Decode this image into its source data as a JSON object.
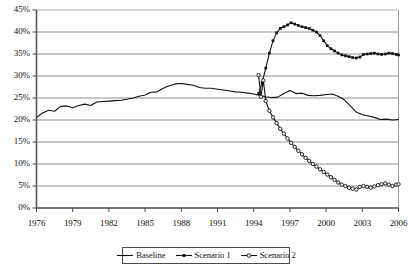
{
  "chart_data": {
    "type": "line",
    "title": "",
    "xlabel": "",
    "ylabel": "",
    "xlim": [
      1976,
      2006
    ],
    "ylim": [
      0,
      45
    ],
    "grid": true,
    "grid_axis": "y",
    "legend_position": "bottom-center",
    "ytick_labels": [
      "0%",
      "5%",
      "10%",
      "15%",
      "20%",
      "25%",
      "30%",
      "35%",
      "40%",
      "45%"
    ],
    "ytick_values": [
      0,
      5,
      10,
      15,
      20,
      25,
      30,
      35,
      40,
      45
    ],
    "xtick_labels": [
      "1976",
      "1979",
      "1982",
      "1985",
      "1988",
      "1991",
      "1994",
      "1997",
      "2000",
      "2003",
      "2006"
    ],
    "xtick_values": [
      1976,
      1979,
      1982,
      1985,
      1988,
      1991,
      1994,
      1997,
      2000,
      2003,
      2006
    ],
    "series": [
      {
        "name": "Baseline",
        "color": "#111111",
        "marker": "none",
        "x": [
          1976,
          1976.5,
          1977,
          1977.5,
          1978,
          1978.5,
          1979,
          1979.5,
          1980,
          1980.5,
          1981,
          1981.5,
          1982,
          1982.5,
          1983,
          1983.5,
          1984,
          1984.5,
          1985,
          1985.5,
          1986,
          1986.5,
          1987,
          1987.5,
          1988,
          1988.5,
          1989,
          1989.5,
          1990,
          1990.5,
          1991,
          1991.5,
          1992,
          1992.5,
          1993,
          1993.5,
          1994,
          1994.5,
          1995,
          1995.5,
          1996,
          1996.5,
          1997,
          1997.5,
          1998,
          1998.5,
          1999,
          1999.5,
          2000,
          2000.5,
          2001,
          2001.5,
          2002,
          2002.5,
          2003,
          2003.5,
          2004,
          2004.5,
          2005,
          2005.5,
          2006
        ],
        "values": [
          20.6,
          21.6,
          22.2,
          22.0,
          23.1,
          23.2,
          22.8,
          23.3,
          23.6,
          23.3,
          24.1,
          24.2,
          24.3,
          24.4,
          24.5,
          24.7,
          25.0,
          25.4,
          25.7,
          26.3,
          26.4,
          27.2,
          27.8,
          28.2,
          28.3,
          28.1,
          27.9,
          27.4,
          27.2,
          27.2,
          27.0,
          26.8,
          26.6,
          26.4,
          26.3,
          26.1,
          25.9,
          25.6,
          25.3,
          25.1,
          25.2,
          26.0,
          26.7,
          26.0,
          26.1,
          25.6,
          25.5,
          25.6,
          25.8,
          25.9,
          25.4,
          24.6,
          23.2,
          21.8,
          21.2,
          20.9,
          20.6,
          20.1,
          20.2,
          20.0,
          20.1
        ]
      },
      {
        "name": "Scenario 1",
        "color": "#111111",
        "marker": "filled-square",
        "x": [
          1994.4,
          1994.7,
          1995,
          1995.3,
          1995.6,
          1995.9,
          1996.2,
          1996.5,
          1996.8,
          1997.1,
          1997.4,
          1997.7,
          1998,
          1998.3,
          1998.6,
          1998.9,
          1999.2,
          1999.5,
          1999.8,
          2000.1,
          2000.4,
          2000.7,
          2001,
          2001.3,
          2001.6,
          2001.9,
          2002.2,
          2002.5,
          2002.8,
          2003.1,
          2003.4,
          2003.7,
          2004,
          2004.3,
          2004.6,
          2004.9,
          2005.2,
          2005.5,
          2005.8,
          2006
        ],
        "values": [
          26.0,
          28.5,
          31.8,
          35.2,
          38.0,
          39.8,
          40.8,
          41.2,
          41.6,
          42.1,
          41.8,
          41.5,
          41.2,
          41.0,
          40.8,
          40.4,
          40.0,
          39.2,
          38.0,
          36.9,
          36.2,
          35.7,
          35.2,
          34.8,
          34.6,
          34.4,
          34.2,
          34.1,
          34.3,
          34.9,
          35.0,
          35.1,
          35.2,
          35.0,
          34.9,
          35.0,
          35.2,
          35.1,
          34.9,
          34.8
        ]
      },
      {
        "name": "Scenario 2",
        "color": "#111111",
        "marker": "open-circle",
        "x": [
          1994.4,
          1994.6,
          1994.8,
          1995,
          1995.3,
          1995.6,
          1995.9,
          1996.2,
          1996.5,
          1996.8,
          1997.1,
          1997.4,
          1997.7,
          1998,
          1998.3,
          1998.6,
          1998.9,
          1999.2,
          1999.5,
          1999.8,
          2000.1,
          2000.4,
          2000.7,
          2001,
          2001.3,
          2001.6,
          2001.9,
          2002.2,
          2002.5,
          2002.8,
          2003.1,
          2003.4,
          2003.7,
          2004,
          2004.3,
          2004.6,
          2004.9,
          2005.2,
          2005.5,
          2005.8,
          2006
        ],
        "values": [
          30.2,
          25.3,
          29.0,
          24.3,
          22.1,
          20.6,
          19.3,
          18.0,
          16.9,
          15.8,
          14.8,
          13.9,
          13.0,
          12.2,
          11.4,
          10.7,
          10.0,
          9.4,
          8.8,
          8.2,
          7.6,
          7.0,
          6.4,
          5.8,
          5.3,
          5.0,
          4.6,
          4.4,
          4.2,
          4.8,
          5.0,
          4.8,
          4.6,
          4.9,
          5.2,
          5.4,
          5.6,
          5.3,
          5.0,
          5.3,
          5.4
        ]
      }
    ]
  },
  "legend": {
    "items": [
      {
        "label": "Baseline",
        "marker": "line-plain"
      },
      {
        "label": "Scenario 1",
        "marker": "line-filled-square"
      },
      {
        "label": "Scenario 2",
        "marker": "line-open-circle"
      }
    ]
  }
}
